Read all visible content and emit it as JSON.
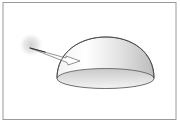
{
  "diagram": {
    "elements": {
      "frame": {
        "stroke": "#9a9a9a"
      },
      "light_source": {
        "label": "",
        "glow_color": "#cfcfcf"
      },
      "arrow": {
        "label": "",
        "stroke": "#555555"
      },
      "dome": {
        "label": "",
        "stroke": "#444444",
        "fill_top": "#ffffff",
        "fill_shade": "#bdbdbd"
      },
      "base_ellipse": {
        "label": "",
        "fill": "#d4d4d4"
      }
    }
  }
}
